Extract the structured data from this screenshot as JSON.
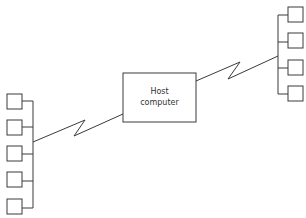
{
  "diagram": {
    "host": {
      "label_line1": "Host",
      "label_line2": "computer",
      "box": {
        "x": 123,
        "y": 73,
        "w": 73,
        "h": 49
      }
    },
    "left_cluster": {
      "bus_x": 33,
      "bus_y1": 101,
      "bus_y2": 208,
      "terminals": [
        {
          "x": 7,
          "y": 94
        },
        {
          "x": 7,
          "y": 120
        },
        {
          "x": 7,
          "y": 146
        },
        {
          "x": 7,
          "y": 172
        },
        {
          "x": 7,
          "y": 199
        }
      ],
      "terminal_size": 15,
      "link": "33,142 85,120 74,136 123,114"
    },
    "right_cluster": {
      "bus_x": 278,
      "bus_y1": 15,
      "bus_y2": 94,
      "terminals": [
        {
          "x": 288,
          "y": 7
        },
        {
          "x": 288,
          "y": 33
        },
        {
          "x": 288,
          "y": 60
        },
        {
          "x": 288,
          "y": 86
        }
      ],
      "terminal_size": 15,
      "link": "196,81 240,62 228,79 278,56"
    },
    "colors": {
      "stroke": "#3a3a3a",
      "text": "#333333",
      "background": "#ffffff"
    }
  }
}
